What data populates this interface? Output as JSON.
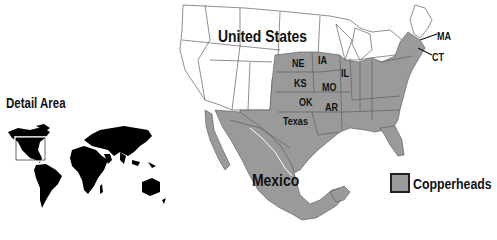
{
  "detail_area": {
    "label": "Detail Area",
    "inset": "world map with North America detail box"
  },
  "labels": {
    "country_us": "United States",
    "country_mexico": "Mexico",
    "states": {
      "ne": "NE",
      "ia": "IA",
      "il": "IL",
      "ks": "KS",
      "mo": "MO",
      "ok": "OK",
      "ar": "AR",
      "tx": "Texas",
      "ma": "MA",
      "ct": "CT"
    }
  },
  "legend": {
    "items": [
      {
        "label": "Copperheads",
        "color": "#9a9a9a"
      }
    ]
  },
  "colors": {
    "range_fill": "#9a9a9a",
    "land_fill": "#ffffff",
    "border": "#555555",
    "world_fill": "#000000"
  }
}
